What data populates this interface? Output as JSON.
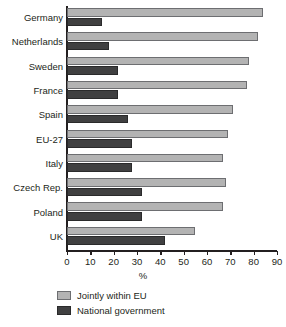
{
  "chart_data": {
    "type": "bar",
    "orientation": "horizontal",
    "title": "",
    "subtitle": "",
    "xlabel": "%",
    "ylabel": "",
    "xlim": [
      0,
      90
    ],
    "xticks": [
      0,
      10,
      20,
      30,
      40,
      50,
      60,
      70,
      80,
      90
    ],
    "xtick_labels": [
      "0",
      "10",
      "20",
      "30",
      "40",
      "50",
      "60",
      "70",
      "80",
      "90"
    ],
    "grid": false,
    "legend_position": "bottom",
    "categories": [
      "Germany",
      "Netherlands",
      "Sweden",
      "France",
      "Spain",
      "EU-27",
      "Italy",
      "Czech Rep.",
      "Poland",
      "UK"
    ],
    "series": [
      {
        "name": "Jointly within EU",
        "color": "#b3b3b3",
        "values": [
          84,
          82,
          78,
          77,
          71,
          69,
          67,
          68,
          67,
          55
        ]
      },
      {
        "name": "National government",
        "color": "#404041",
        "values": [
          15,
          18,
          22,
          22,
          26,
          28,
          28,
          32,
          32,
          42
        ]
      }
    ]
  },
  "legend": {
    "items": [
      {
        "label": "Jointly within EU"
      },
      {
        "label": "National government"
      }
    ]
  },
  "axis": {
    "x_title": "%"
  },
  "colors": {
    "series_light": "#b3b3b3",
    "series_dark": "#404041",
    "axis": "#231f20",
    "background": "#ffffff"
  }
}
